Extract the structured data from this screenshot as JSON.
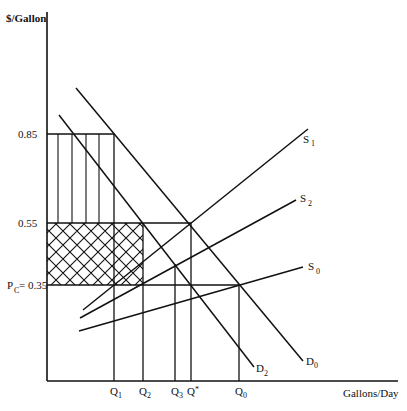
{
  "chart_data": {
    "type": "line",
    "title": "",
    "xlabel": "Gallons/Day",
    "ylabel": "$/Gallon",
    "grid": false,
    "legend": "none (curves labeled inline)",
    "y_ticks": [
      {
        "label": "0.85",
        "value": 0.85
      },
      {
        "label": "0.55",
        "value": 0.55
      },
      {
        "label": "P_C = 0.35",
        "main": "P",
        "sub": "C",
        "suffix": "= 0.35",
        "value": 0.35
      }
    ],
    "x_ticks": [
      {
        "label": "Q1",
        "main": "Q",
        "sub": "1"
      },
      {
        "label": "Q2",
        "main": "Q",
        "sub": "2"
      },
      {
        "label": "Q3",
        "main": "Q",
        "sub": "3"
      },
      {
        "label": "Q*",
        "main": "Q",
        "sub": "*"
      },
      {
        "label": "Q0",
        "main": "Q",
        "sub": "0"
      }
    ],
    "series": [
      {
        "name": "D0",
        "kind": "demand",
        "main": "D",
        "sub": "0"
      },
      {
        "name": "D2",
        "kind": "demand",
        "main": "D",
        "sub": "2"
      },
      {
        "name": "S1",
        "kind": "supply",
        "main": "S",
        "sub": "1"
      },
      {
        "name": "S2",
        "kind": "supply",
        "main": "S",
        "sub": "2"
      },
      {
        "name": "S0",
        "kind": "supply",
        "main": "S",
        "sub": "0"
      }
    ],
    "annotations": [
      "Vertical-hatched rectangle between price 0.55 and 0.85 from 0 to Q1",
      "Cross-hatched rectangle between price 0.35 and 0.55 from 0 to Q2",
      "Equilibrium S0/D0 at (Q0, 0.35); S1/D0 at (Q*, 0.55); S2/D2 at (Q3, ~0.43)"
    ]
  },
  "geometry": {
    "axis": {
      "x0": 47,
      "y_top": 12,
      "y0": 381,
      "x_end": 398
    },
    "price_y": {
      "p085": 134,
      "p055": 223,
      "p035": 285
    },
    "q_x": {
      "q1": 114,
      "q2": 143,
      "q3": 175,
      "qstar": 191,
      "q0": 239
    },
    "vhatch_x": [
      58,
      72,
      86,
      99
    ],
    "curves": {
      "D0": [
        76,
        88,
        303,
        361
      ],
      "D2": [
        59,
        115,
        254,
        367
      ],
      "S1": [
        83,
        310,
        308,
        129
      ],
      "S2": [
        80,
        318,
        296,
        200
      ],
      "S0": [
        79,
        331,
        303,
        267
      ]
    }
  }
}
